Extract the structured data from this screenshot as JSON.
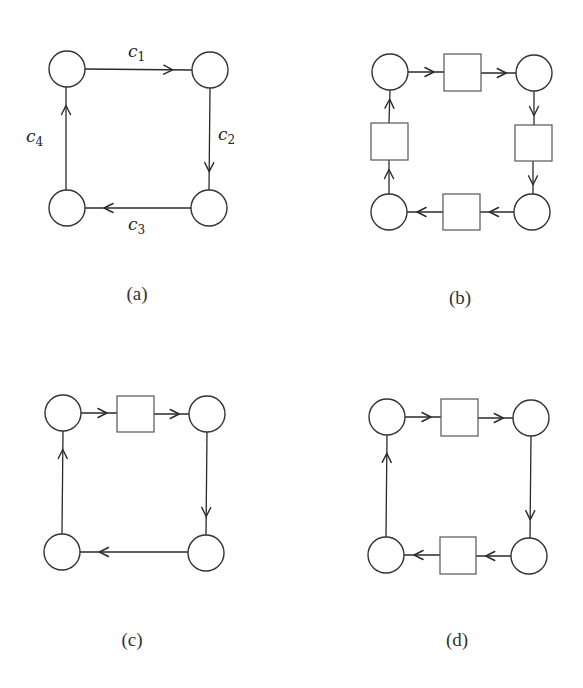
{
  "figure": {
    "colors": {
      "stroke": "#333333",
      "fill": "#ffffff",
      "text": "#222222"
    },
    "panels": [
      {
        "id": "a",
        "caption": "(a)",
        "caption_pos": [
          137,
          300
        ],
        "circles": [
          {
            "id": "a-n1",
            "cx": 67,
            "cy": 69,
            "r": 18
          },
          {
            "id": "a-n2",
            "cx": 210,
            "cy": 70,
            "r": 18
          },
          {
            "id": "a-n3",
            "cx": 209,
            "cy": 208,
            "r": 18
          },
          {
            "id": "a-n4",
            "cx": 67,
            "cy": 208,
            "r": 18
          }
        ],
        "squares": [],
        "edges": [
          {
            "from": [
              85,
              69
            ],
            "to": [
              192,
              70
            ],
            "label": "c",
            "sub": "1",
            "label_pos": [
              128,
              57
            ]
          },
          {
            "from": [
              210,
              88
            ],
            "to": [
              209,
              190
            ],
            "label": "c",
            "sub": "2",
            "label_pos": [
              218,
              140
            ]
          },
          {
            "from": [
              191,
              208
            ],
            "to": [
              85,
              208
            ],
            "label": "c",
            "sub": "3",
            "label_pos": [
              128,
              230
            ]
          },
          {
            "from": [
              66,
              190
            ],
            "to": [
              66,
              87
            ],
            "label": "c",
            "sub": "4",
            "label_pos": [
              26,
              142
            ]
          }
        ]
      },
      {
        "id": "b",
        "caption": "(b)",
        "caption_pos": [
          460,
          304
        ],
        "circles": [
          {
            "id": "b-n1",
            "cx": 390,
            "cy": 72,
            "r": 18
          },
          {
            "id": "b-n2",
            "cx": 534,
            "cy": 73,
            "r": 18
          },
          {
            "id": "b-n3",
            "cx": 532,
            "cy": 212,
            "r": 18
          },
          {
            "id": "b-n4",
            "cx": 389,
            "cy": 212,
            "r": 18
          }
        ],
        "squares": [
          {
            "id": "b-s1",
            "x": 444,
            "y": 54,
            "w": 37,
            "h": 37
          },
          {
            "id": "b-s2",
            "x": 515,
            "y": 125,
            "w": 37,
            "h": 36
          },
          {
            "id": "b-s3",
            "x": 443,
            "y": 194,
            "w": 37,
            "h": 36
          },
          {
            "id": "b-s4",
            "x": 371,
            "y": 123,
            "w": 37,
            "h": 37
          }
        ],
        "edges": [
          {
            "from": [
              408,
              72
            ],
            "to": [
              444,
              72
            ]
          },
          {
            "from": [
              481,
              73
            ],
            "to": [
              516,
              73
            ]
          },
          {
            "from": [
              534,
              91
            ],
            "to": [
              534,
              125
            ]
          },
          {
            "from": [
              533,
              161
            ],
            "to": [
              533,
              194
            ]
          },
          {
            "from": [
              514,
              212
            ],
            "to": [
              480,
              212
            ]
          },
          {
            "from": [
              443,
              212
            ],
            "to": [
              407,
              212
            ]
          },
          {
            "from": [
              389,
              194
            ],
            "to": [
              389,
              160
            ]
          },
          {
            "from": [
              389,
              123
            ],
            "to": [
              390,
              90
            ]
          }
        ]
      },
      {
        "id": "c",
        "caption": "(c)",
        "caption_pos": [
          132,
          646
        ],
        "circles": [
          {
            "id": "c-n1",
            "cx": 63,
            "cy": 413,
            "r": 18
          },
          {
            "id": "c-n2",
            "cx": 207,
            "cy": 414,
            "r": 18
          },
          {
            "id": "c-n3",
            "cx": 206,
            "cy": 553,
            "r": 18
          },
          {
            "id": "c-n4",
            "cx": 62,
            "cy": 552,
            "r": 18
          }
        ],
        "squares": [
          {
            "id": "c-s1",
            "x": 117,
            "y": 396,
            "w": 37,
            "h": 36
          }
        ],
        "edges": [
          {
            "from": [
              81,
              413
            ],
            "to": [
              117,
              413
            ]
          },
          {
            "from": [
              154,
              414
            ],
            "to": [
              189,
              414
            ]
          },
          {
            "from": [
              207,
              432
            ],
            "to": [
              206,
              535
            ]
          },
          {
            "from": [
              188,
              552
            ],
            "to": [
              80,
              552
            ]
          },
          {
            "from": [
              62,
              534
            ],
            "to": [
              63,
              431
            ]
          }
        ]
      },
      {
        "id": "d",
        "caption": "(d)",
        "caption_pos": [
          457,
          646
        ],
        "circles": [
          {
            "id": "d-n1",
            "cx": 387,
            "cy": 417,
            "r": 18
          },
          {
            "id": "d-n2",
            "cx": 531,
            "cy": 418,
            "r": 18
          },
          {
            "id": "d-n3",
            "cx": 529,
            "cy": 556,
            "r": 18
          },
          {
            "id": "d-n4",
            "cx": 386,
            "cy": 555,
            "r": 18
          }
        ],
        "squares": [
          {
            "id": "d-s1",
            "x": 441,
            "y": 399,
            "w": 37,
            "h": 37
          },
          {
            "id": "d-s2",
            "x": 440,
            "y": 537,
            "w": 36,
            "h": 37
          }
        ],
        "edges": [
          {
            "from": [
              405,
              417
            ],
            "to": [
              441,
              417
            ]
          },
          {
            "from": [
              478,
              418
            ],
            "to": [
              513,
              418
            ]
          },
          {
            "from": [
              531,
              436
            ],
            "to": [
              530,
              538
            ]
          },
          {
            "from": [
              511,
              556
            ],
            "to": [
              476,
              556
            ]
          },
          {
            "from": [
              440,
              555
            ],
            "to": [
              404,
              555
            ]
          },
          {
            "from": [
              386,
              537
            ],
            "to": [
              387,
              435
            ]
          }
        ]
      }
    ]
  }
}
